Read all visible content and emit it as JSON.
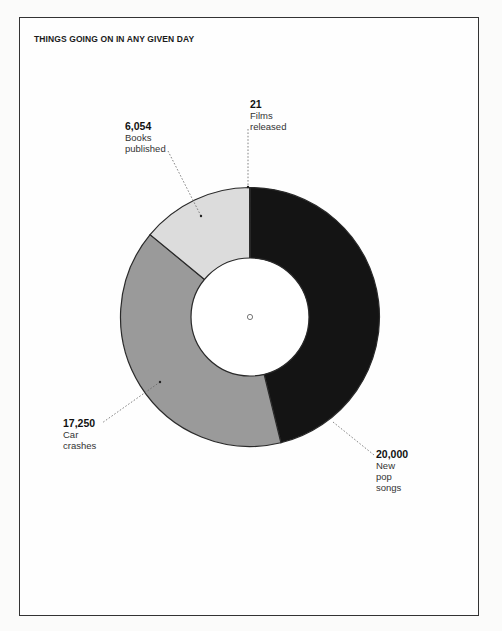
{
  "chart_data": {
    "type": "pie",
    "subtype": "donut",
    "title": "THINGS GOING ON IN ANY GIVEN DAY",
    "categories": [
      "New pop songs",
      "Car crashes",
      "Books published",
      "Films released"
    ],
    "values": [
      20000,
      17250,
      6054,
      21
    ],
    "colors": [
      "#141414",
      "#9a9a9a",
      "#dcdcdc",
      "#555555"
    ],
    "start_angle_deg": 0,
    "direction": "clockwise",
    "legend": "none",
    "annotations": [
      {
        "value_label": "20,000",
        "label_lines": [
          "New",
          "pop",
          "songs"
        ]
      },
      {
        "value_label": "17,250",
        "label_lines": [
          "Car",
          "crashes"
        ]
      },
      {
        "value_label": "6,054",
        "label_lines": [
          "Books",
          "published"
        ]
      },
      {
        "value_label": "21",
        "label_lines": [
          "Films",
          "released"
        ]
      }
    ]
  },
  "labels": {
    "pop": {
      "num": "20,000",
      "l1": "New",
      "l2": "pop",
      "l3": "songs"
    },
    "cars": {
      "num": "17,250",
      "l1": "Car",
      "l2": "crashes"
    },
    "books": {
      "num": "6,054",
      "l1": "Books",
      "l2": "published"
    },
    "films": {
      "num": "21",
      "l1": "Films",
      "l2": "released"
    }
  }
}
